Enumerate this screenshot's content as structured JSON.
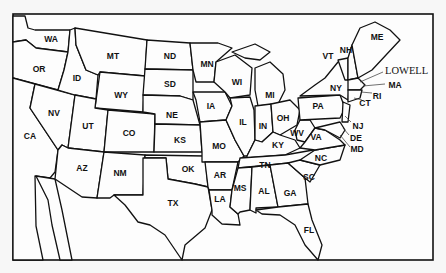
{
  "map": {
    "title": "Contiguous United States",
    "states": [
      {
        "abbr": "WA",
        "x": 51,
        "y": 39
      },
      {
        "abbr": "OR",
        "x": 39,
        "y": 69
      },
      {
        "abbr": "CA",
        "x": 30,
        "y": 136
      },
      {
        "abbr": "ID",
        "x": 77,
        "y": 78
      },
      {
        "abbr": "NV",
        "x": 54,
        "y": 113
      },
      {
        "abbr": "MT",
        "x": 113,
        "y": 56
      },
      {
        "abbr": "WY",
        "x": 121,
        "y": 95
      },
      {
        "abbr": "UT",
        "x": 88,
        "y": 126
      },
      {
        "abbr": "CO",
        "x": 129,
        "y": 133
      },
      {
        "abbr": "AZ",
        "x": 82,
        "y": 168
      },
      {
        "abbr": "NM",
        "x": 120,
        "y": 173
      },
      {
        "abbr": "ND",
        "x": 170,
        "y": 56
      },
      {
        "abbr": "SD",
        "x": 170,
        "y": 84
      },
      {
        "abbr": "NE",
        "x": 172,
        "y": 115
      },
      {
        "abbr": "KS",
        "x": 180,
        "y": 140
      },
      {
        "abbr": "OK",
        "x": 188,
        "y": 169
      },
      {
        "abbr": "TX",
        "x": 173,
        "y": 203
      },
      {
        "abbr": "MN",
        "x": 207,
        "y": 64
      },
      {
        "abbr": "IA",
        "x": 211,
        "y": 106
      },
      {
        "abbr": "MO",
        "x": 219,
        "y": 146
      },
      {
        "abbr": "AR",
        "x": 220,
        "y": 175
      },
      {
        "abbr": "LA",
        "x": 220,
        "y": 199
      },
      {
        "abbr": "WI",
        "x": 237,
        "y": 82
      },
      {
        "abbr": "IL",
        "x": 243,
        "y": 122
      },
      {
        "abbr": "MS",
        "x": 240,
        "y": 188
      },
      {
        "abbr": "MI",
        "x": 270,
        "y": 95
      },
      {
        "abbr": "IN",
        "x": 263,
        "y": 126
      },
      {
        "abbr": "KY",
        "x": 278,
        "y": 145
      },
      {
        "abbr": "TN",
        "x": 265,
        "y": 165
      },
      {
        "abbr": "AL",
        "x": 264,
        "y": 191
      },
      {
        "abbr": "OH",
        "x": 283,
        "y": 118
      },
      {
        "abbr": "GA",
        "x": 290,
        "y": 193
      },
      {
        "abbr": "FL",
        "x": 309,
        "y": 230
      },
      {
        "abbr": "WV",
        "x": 297,
        "y": 133
      },
      {
        "abbr": "VA",
        "x": 316,
        "y": 137
      },
      {
        "abbr": "NC",
        "x": 321,
        "y": 158
      },
      {
        "abbr": "SC",
        "x": 309,
        "y": 177
      },
      {
        "abbr": "PA",
        "x": 318,
        "y": 106
      },
      {
        "abbr": "NY",
        "x": 336,
        "y": 88
      },
      {
        "abbr": "VT",
        "x": 328,
        "y": 56
      },
      {
        "abbr": "NH",
        "x": 346,
        "y": 50
      },
      {
        "abbr": "ME",
        "x": 377,
        "y": 37
      },
      {
        "abbr": "MA",
        "x": 395,
        "y": 85
      },
      {
        "abbr": "RI",
        "x": 377,
        "y": 96
      },
      {
        "abbr": "CT",
        "x": 365,
        "y": 103
      },
      {
        "abbr": "NJ",
        "x": 358,
        "y": 126
      },
      {
        "abbr": "DE",
        "x": 356,
        "y": 138
      },
      {
        "abbr": "MD",
        "x": 357,
        "y": 149
      }
    ],
    "city_label": "LOWELL"
  }
}
